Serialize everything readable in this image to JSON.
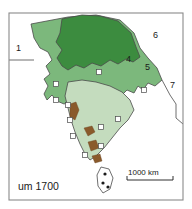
{
  "figure": {
    "caption_date": "um 1700",
    "frame": {
      "x": 9,
      "y": 13,
      "width": 174,
      "height": 187
    }
  },
  "colors": {
    "dark_green": "#3c8c3f",
    "mid_green": "#7cb87c",
    "light_green": "#c4dcbe",
    "pale_green": "#a9cfa4",
    "brown": "#8a5a2b",
    "border": "#4a4a4a",
    "frame": "#8a8a8a",
    "background": "#ffffff",
    "marker_fill": "#ffffff",
    "text": "#1a1a1a"
  },
  "region_labels": [
    {
      "id": "1",
      "text": "1",
      "x": 16,
      "y": 51
    },
    {
      "id": "4",
      "text": "4",
      "x": 126,
      "y": 62
    },
    {
      "id": "5",
      "text": "5",
      "x": 145,
      "y": 70
    },
    {
      "id": "6",
      "text": "6",
      "x": 153,
      "y": 38
    },
    {
      "id": "7",
      "text": "7",
      "x": 170,
      "y": 88
    }
  ],
  "scale_bar": {
    "label": "1000 km",
    "x": 128,
    "y": 175,
    "length": 46
  },
  "map_areas": [
    {
      "name": "dark-green-territory",
      "shade": "dark_green"
    },
    {
      "name": "mid-green-territory",
      "shade": "mid_green"
    },
    {
      "name": "light-green-territory",
      "shade": "light_green"
    },
    {
      "name": "brown-highland-patches",
      "shade": "brown"
    },
    {
      "name": "sri-lanka-island",
      "shade": "background"
    }
  ],
  "markers": {
    "settlement_squares": [
      {
        "x": 99,
        "y": 72
      },
      {
        "x": 56,
        "y": 84
      },
      {
        "x": 144,
        "y": 90
      },
      {
        "x": 56,
        "y": 100
      },
      {
        "x": 68,
        "y": 105
      },
      {
        "x": 70,
        "y": 120
      },
      {
        "x": 118,
        "y": 119
      },
      {
        "x": 73,
        "y": 136
      },
      {
        "x": 101,
        "y": 127
      },
      {
        "x": 101,
        "y": 146
      },
      {
        "x": 85,
        "y": 155
      }
    ],
    "island_dots": [
      {
        "x": 105,
        "y": 174
      },
      {
        "x": 103,
        "y": 183
      },
      {
        "x": 108,
        "y": 187
      }
    ]
  }
}
